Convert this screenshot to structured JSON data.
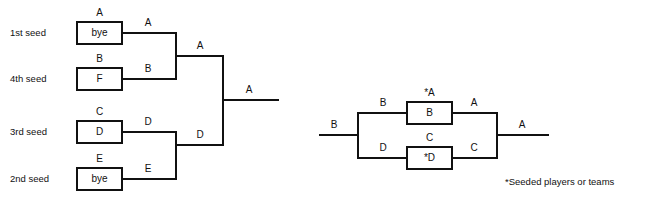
{
  "figure": {
    "stroke_color": "#111111",
    "background_color": "#ffffff"
  },
  "left_bracket": {
    "name": "single-elimination-bracket",
    "seed_labels": [
      {
        "text": "1st seed",
        "x": 10,
        "y": 33
      },
      {
        "text": "4th seed",
        "x": 10,
        "y": 79
      },
      {
        "text": "3rd seed",
        "x": 10,
        "y": 132
      },
      {
        "text": "2nd seed",
        "x": 10,
        "y": 179
      }
    ],
    "boxes": [
      {
        "id": "box-1st",
        "cap": "A",
        "value": "bye",
        "x": 77,
        "y": 22,
        "w": 45,
        "h": 22,
        "cap_x": 99.5,
        "cap_y": 13
      },
      {
        "id": "box-4th",
        "cap": "B",
        "value": "F",
        "x": 77,
        "y": 68,
        "w": 45,
        "h": 22,
        "cap_x": 99.5,
        "cap_y": 59
      },
      {
        "id": "box-3rd",
        "cap": "C",
        "value": "D",
        "x": 77,
        "y": 121,
        "w": 45,
        "h": 22,
        "cap_x": 99.5,
        "cap_y": 112
      },
      {
        "id": "box-2nd",
        "cap": "E",
        "value": "bye",
        "x": 77,
        "y": 168,
        "w": 45,
        "h": 22,
        "cap_x": 99.5,
        "cap_y": 159
      }
    ],
    "lines": [
      {
        "id": "r1-top-out",
        "x1": 122,
        "y1": 33,
        "x2": 176,
        "y2": 33
      },
      {
        "id": "r1-upper-join",
        "x1": 176,
        "y1": 33,
        "x2": 176,
        "y2": 79
      },
      {
        "id": "r1-second-out",
        "x1": 122,
        "y1": 79,
        "x2": 176,
        "y2": 79
      },
      {
        "id": "r2-upper-out",
        "x1": 176,
        "y1": 56,
        "x2": 223,
        "y2": 56
      },
      {
        "id": "r1-third-out",
        "x1": 122,
        "y1": 132,
        "x2": 176,
        "y2": 132
      },
      {
        "id": "r1-lower-join",
        "x1": 176,
        "y1": 132,
        "x2": 176,
        "y2": 179
      },
      {
        "id": "r1-bottom-out",
        "x1": 122,
        "y1": 179,
        "x2": 176,
        "y2": 179
      },
      {
        "id": "r2-lower-out",
        "x1": 176,
        "y1": 145,
        "x2": 223,
        "y2": 145
      },
      {
        "id": "final-join",
        "x1": 223,
        "y1": 56,
        "x2": 223,
        "y2": 145
      },
      {
        "id": "champion-out",
        "x1": 223,
        "y1": 100,
        "x2": 278,
        "y2": 100
      }
    ],
    "edge_labels": [
      {
        "id": "label-r1-a",
        "text": "A",
        "x": 148,
        "y": 23
      },
      {
        "id": "label-r1-b",
        "text": "B",
        "x": 148,
        "y": 69
      },
      {
        "id": "label-r1-d",
        "text": "D",
        "x": 148,
        "y": 122
      },
      {
        "id": "label-r1-e",
        "text": "E",
        "x": 148,
        "y": 169
      },
      {
        "id": "label-r2-a",
        "text": "A",
        "x": 200,
        "y": 46
      },
      {
        "id": "label-r2-d",
        "text": "D",
        "x": 200,
        "y": 135
      },
      {
        "id": "label-final-a",
        "text": "A",
        "x": 249,
        "y": 90
      }
    ]
  },
  "right_diagram": {
    "name": "seeded-pair-diagram",
    "boxes": [
      {
        "id": "box-seeded-a",
        "cap": "*A",
        "value": "B",
        "x": 407,
        "y": 102,
        "w": 45,
        "h": 22,
        "cap_x": 429.5,
        "cap_y": 93
      },
      {
        "id": "box-seeded-d",
        "cap": "C",
        "value": "*D",
        "x": 407,
        "y": 147,
        "w": 45,
        "h": 22,
        "cap_x": 429.5,
        "cap_y": 138
      }
    ],
    "lines": [
      {
        "id": "input-line",
        "x1": 320,
        "y1": 135,
        "x2": 358,
        "y2": 135
      },
      {
        "id": "input-split",
        "x1": 358,
        "y1": 113,
        "x2": 358,
        "y2": 158
      },
      {
        "id": "branch-upper-in",
        "x1": 358,
        "y1": 113,
        "x2": 407,
        "y2": 113
      },
      {
        "id": "branch-lower-in",
        "x1": 358,
        "y1": 158,
        "x2": 407,
        "y2": 158
      },
      {
        "id": "branch-upper-out",
        "x1": 452,
        "y1": 113,
        "x2": 497,
        "y2": 113
      },
      {
        "id": "branch-lower-out",
        "x1": 452,
        "y1": 158,
        "x2": 497,
        "y2": 158
      },
      {
        "id": "output-merge",
        "x1": 497,
        "y1": 113,
        "x2": 497,
        "y2": 158
      },
      {
        "id": "output-line",
        "x1": 497,
        "y1": 135,
        "x2": 548,
        "y2": 135
      }
    ],
    "edge_labels": [
      {
        "id": "label-input-b",
        "text": "B",
        "x": 334,
        "y": 125
      },
      {
        "id": "label-upper-b",
        "text": "B",
        "x": 383,
        "y": 103
      },
      {
        "id": "label-lower-d",
        "text": "D",
        "x": 383,
        "y": 148
      },
      {
        "id": "label-upper-a",
        "text": "A",
        "x": 474,
        "y": 103
      },
      {
        "id": "label-lower-c",
        "text": "C",
        "x": 474,
        "y": 148
      },
      {
        "id": "label-output-a",
        "text": "A",
        "x": 522,
        "y": 125
      }
    ],
    "footnote": {
      "text": "*Seeded players or teams",
      "x": 505,
      "y": 182
    }
  }
}
